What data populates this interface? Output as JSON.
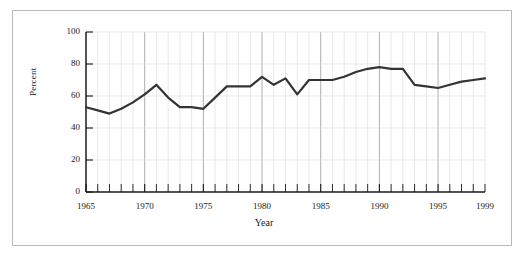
{
  "figure": {
    "y_axis_title": "Percent",
    "x_axis_title": "Year"
  },
  "chart_data": {
    "type": "line",
    "title": "",
    "xlabel": "Year",
    "ylabel": "Percent",
    "xlim": [
      1965,
      1999
    ],
    "ylim": [
      0,
      100
    ],
    "grid": true,
    "legend": null,
    "x_tick_labels": [
      "1965",
      "1970",
      "1975",
      "1980",
      "1985",
      "1990",
      "1995",
      "1999"
    ],
    "x_ticks": [
      1965,
      1970,
      1975,
      1980,
      1985,
      1990,
      1995,
      1999
    ],
    "y_tick_labels": [
      "0",
      "20",
      "40",
      "60",
      "80",
      "100"
    ],
    "y_ticks": [
      0,
      20,
      40,
      60,
      80,
      100
    ],
    "x": [
      1965,
      1966,
      1967,
      1968,
      1969,
      1970,
      1971,
      1972,
      1973,
      1974,
      1975,
      1976,
      1977,
      1978,
      1979,
      1980,
      1981,
      1982,
      1983,
      1984,
      1985,
      1986,
      1987,
      1988,
      1989,
      1990,
      1991,
      1992,
      1993,
      1994,
      1995,
      1996,
      1997,
      1998,
      1999
    ],
    "values": [
      53,
      51,
      49,
      52,
      56,
      61,
      67,
      59,
      53,
      53,
      52,
      59,
      66,
      66,
      66,
      72,
      67,
      71,
      61,
      70,
      70,
      70,
      72,
      75,
      77,
      78,
      77,
      77,
      67,
      66,
      65,
      67,
      69,
      70,
      71
    ],
    "series": [
      {
        "name": "Percent",
        "color": "#333333",
        "line_width": 2.2,
        "values": [
          53,
          51,
          49,
          52,
          56,
          61,
          67,
          59,
          53,
          53,
          52,
          59,
          66,
          66,
          66,
          72,
          67,
          71,
          61,
          70,
          70,
          70,
          72,
          75,
          77,
          78,
          77,
          77,
          67,
          66,
          65,
          67,
          69,
          70,
          71
        ]
      }
    ],
    "colors": {
      "line": "#333333",
      "axis": "#1a1a1a",
      "gridline_minor": "#d8d8d8",
      "gridline_major": "#9a9a9a",
      "frame_border": "#b9b9b9",
      "background": "#ffffff"
    }
  }
}
